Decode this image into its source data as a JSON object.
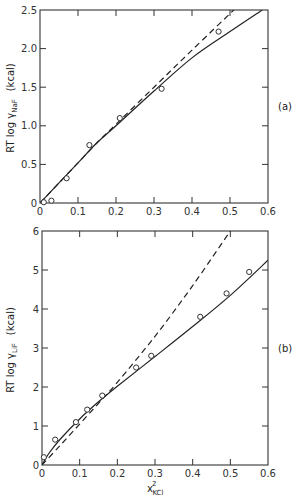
{
  "chart_data": [
    {
      "panel": "(a)",
      "type": "line",
      "title": "",
      "xlabel": "",
      "ylabel": "RT log γ_NaF (kcal)",
      "ylabel_main": "RT log γ",
      "ylabel_sub": "NaF",
      "ylabel_unit": "(kcal)",
      "xlim": [
        0,
        0.6
      ],
      "ylim": [
        0,
        2.5
      ],
      "xticks": [
        "0",
        "0.1",
        "0.2",
        "0.3",
        "0.4",
        "0.5",
        "0.6"
      ],
      "yticks": [
        "0",
        "0.5",
        "1.0",
        "1.5",
        "2.0",
        "2.5"
      ],
      "grid": false,
      "series": [
        {
          "name": "experimental",
          "style": "circles",
          "x": [
            0.01,
            0.03,
            0.07,
            0.13,
            0.21,
            0.32,
            0.47
          ],
          "y": [
            0.01,
            0.03,
            0.32,
            0.75,
            1.1,
            1.48,
            2.22
          ]
        },
        {
          "name": "solid curve",
          "style": "solid",
          "x": [
            0,
            0.05,
            0.1,
            0.15,
            0.2,
            0.3,
            0.4,
            0.5,
            0.585
          ],
          "y": [
            0,
            0.26,
            0.52,
            0.78,
            1.0,
            1.45,
            1.88,
            2.22,
            2.5
          ]
        },
        {
          "name": "dashed curve",
          "style": "dashed",
          "x": [
            0,
            0.05,
            0.1,
            0.15,
            0.2,
            0.3,
            0.4,
            0.51
          ],
          "y": [
            0,
            0.26,
            0.52,
            0.78,
            1.02,
            1.5,
            1.98,
            2.5
          ]
        }
      ]
    },
    {
      "panel": "(b)",
      "type": "line",
      "title": "",
      "xlabel": "x²KCl",
      "xlabel_main": "x",
      "xlabel_sup": "2",
      "xlabel_sub": "KCl",
      "ylabel": "RT log γ_LiF (kcal)",
      "ylabel_main": "RT log γ",
      "ylabel_sub": "LiF",
      "ylabel_unit": "(kcal)",
      "xlim": [
        0,
        0.6
      ],
      "ylim": [
        0,
        6
      ],
      "xticks": [
        "0",
        "0.1",
        "0.2",
        "0.3",
        "0.4",
        "0.5",
        "0.6"
      ],
      "yticks": [
        "0",
        "1",
        "2",
        "3",
        "4",
        "5",
        "6"
      ],
      "grid": false,
      "series": [
        {
          "name": "experimental",
          "style": "circles",
          "x": [
            0.005,
            0.035,
            0.09,
            0.12,
            0.16,
            0.25,
            0.29,
            0.42,
            0.49,
            0.55
          ],
          "y": [
            0.2,
            0.65,
            1.1,
            1.42,
            1.78,
            2.5,
            2.8,
            3.8,
            4.4,
            4.95
          ]
        },
        {
          "name": "solid curve",
          "style": "solid",
          "x": [
            0,
            0.02,
            0.05,
            0.1,
            0.15,
            0.2,
            0.3,
            0.4,
            0.5,
            0.6
          ],
          "y": [
            0,
            0.32,
            0.68,
            1.18,
            1.62,
            2.02,
            2.78,
            3.55,
            4.35,
            5.25
          ]
        },
        {
          "name": "dashed curve",
          "style": "dashed",
          "x": [
            0,
            0.05,
            0.1,
            0.15,
            0.2,
            0.3,
            0.4,
            0.5
          ],
          "y": [
            0,
            0.52,
            1.05,
            1.58,
            2.12,
            3.3,
            4.6,
            6.0
          ]
        }
      ]
    }
  ],
  "labels": {
    "panel_a": "(a)",
    "panel_b": "(b)"
  }
}
